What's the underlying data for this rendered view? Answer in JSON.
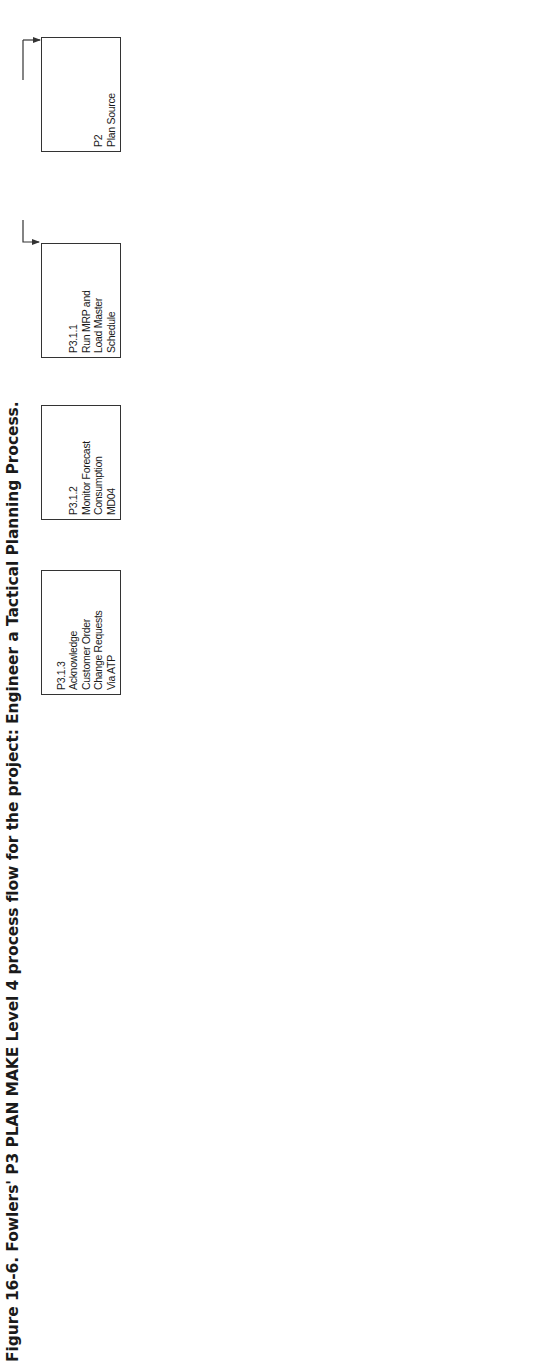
{
  "caption": "Figure 16-6. Fowlers' P3 PLAN MAKE Level 4 process flow for the project: Engineer a Tactical Planning Process.",
  "orientation": "page rotated 90° counter-clockwise",
  "colors": {
    "line": "#333333",
    "text": "#1a1a1a",
    "background": "#ffffff"
  },
  "boxes": [
    {
      "id": "P2",
      "text": "Plan Source"
    },
    {
      "id": "P3.1.1",
      "text": "Run MRP and\nLoad Master\nSchedule"
    },
    {
      "id": "P3.1.2",
      "text": "Monitor Forecast\nConsumption\nMD04"
    },
    {
      "id": "P3.1.3",
      "text": "Acknowledge\nCustomer Order\nChange Requests\nVia ATP"
    },
    {
      "id": "P3.1.4",
      "text": "Adjust Master\nSchedule Within\nPolicy Guidelines"
    },
    {
      "id": "D1.3",
      "text": "Reserve Inventory\nand Determine\nDelivery Date"
    },
    {
      "id": "P3.2.1",
      "text": "Validate Capacity\nPlan in CM01"
    },
    {
      "id": "P3.2.2",
      "text": "Analyze Demand\nSupply Mismatches"
    },
    {
      "id": "P3.3.1",
      "text": "Resolve Demand\nSupply Mismatches"
    },
    {
      "id": "P3.3.2",
      "text": "Reconcile Master\nSchedule to Rough-\nCut Capacity Plan"
    },
    {
      "id": "P1.2",
      "text": "Identify, Prioritize\nand Aggregate\nSupply Chain\nResources"
    },
    {
      "id": "P3.4.1",
      "text": "Conduct Master\nScheduling Weekly\nMeeting"
    },
    {
      "id": "P3.4.1",
      "text": "Release 2-Week\nProduction Schedule"
    },
    {
      "id": "M1.1",
      "text": "Schedule Production\nActivities"
    },
    {
      "id": "EP3",
      "text": "Manage PLAN\nData Collection"
    },
    {
      "id": "EP1",
      "text": "Manage Business\nRules for Plan\nProcess"
    }
  ],
  "flow_labels": {
    "time_phased": "Time Phased Material Plans",
    "master_policy": "Master Scheduling Policy"
  },
  "rules_list": [
    "*Planning Time Fence",
    "*Safety Stock",
    "*Action Message Profile",
    "*Forecast Consumption Rules",
    "*Lot Size",
    "*Bill of Materials"
  ],
  "connections": [
    {
      "from": "Time Phased Material Plans",
      "to": [
        "P2",
        "P3.1.1"
      ]
    },
    {
      "from": "P3.1.1",
      "to": "P3.1.2"
    },
    {
      "from": "P3.1.1",
      "to": "P3.2.1"
    },
    {
      "from": "P3.1.2",
      "to": "P3.1.3",
      "bidirectional": true
    },
    {
      "from": "P3.1.3",
      "to": "P3.1.4"
    },
    {
      "from": "P3.1.3",
      "to": "D1.3",
      "bidirectional": true
    },
    {
      "from": "P3.2.1",
      "to": "P3.2.2"
    },
    {
      "from": "P3.2.2",
      "to": "P3.1.4",
      "bidirectional": true
    },
    {
      "from": "P3.2.2",
      "to": "P3.3.1"
    },
    {
      "from": "P3.3.1",
      "to": "P3.3.2"
    },
    {
      "from": "P3.3.1",
      "to": "P3.4.1 (Conduct Master Scheduling Weekly Meeting)"
    },
    {
      "from": "P3.3.2",
      "to": "P1.2"
    },
    {
      "from": "P3.4.1 (Conduct Master Scheduling Weekly Meeting)",
      "to": "P3.4.1 (Release 2-Week Production Schedule)"
    },
    {
      "from": "P3.4.1 (Release 2-Week Production Schedule)",
      "to": "M1.1"
    },
    {
      "from": "EP1",
      "to": "P3.2.2",
      "label": "Master Scheduling Policy"
    },
    {
      "from": "EP3",
      "to": "P3.1.1",
      "label": "Planning rules list"
    }
  ]
}
